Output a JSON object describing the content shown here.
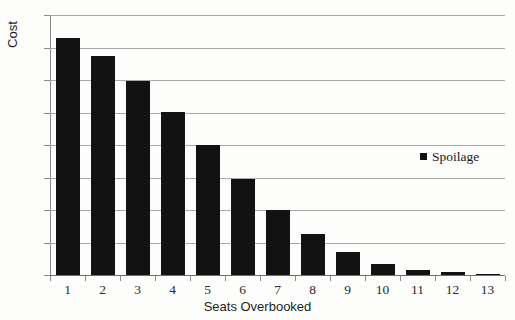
{
  "chart_data": {
    "type": "bar",
    "title": "",
    "xlabel": "Seats Overbooked",
    "ylabel": "Cost",
    "categories": [
      "1",
      "2",
      "3",
      "4",
      "5",
      "6",
      "7",
      "8",
      "9",
      "10",
      "11",
      "12",
      "13"
    ],
    "series": [
      {
        "name": "Spoilage",
        "color": "#121212",
        "values": [
          73,
          67.5,
          59.8,
          50.3,
          40,
          29.4,
          20,
          12.5,
          7.2,
          3.5,
          1.5,
          0.8,
          0.4
        ]
      }
    ],
    "ylim": [
      0,
      80
    ],
    "yticks": [
      "0",
      "10",
      "20",
      "30",
      "40",
      "50",
      "60",
      "70",
      "80"
    ],
    "grid": true,
    "legend_position": "right-middle"
  },
  "legend": {
    "entries": [
      {
        "label": "Spoilage",
        "marker": "filled-square-marker"
      }
    ]
  },
  "axes": {
    "y_title": "Cost",
    "x_title": "Seats Overbooked"
  },
  "colors": {
    "bar": "#121212",
    "gridline": "#a9a9a9",
    "axis": "#8a8a8a",
    "text": "#1e1e1e",
    "background": "#fdfdfc"
  }
}
